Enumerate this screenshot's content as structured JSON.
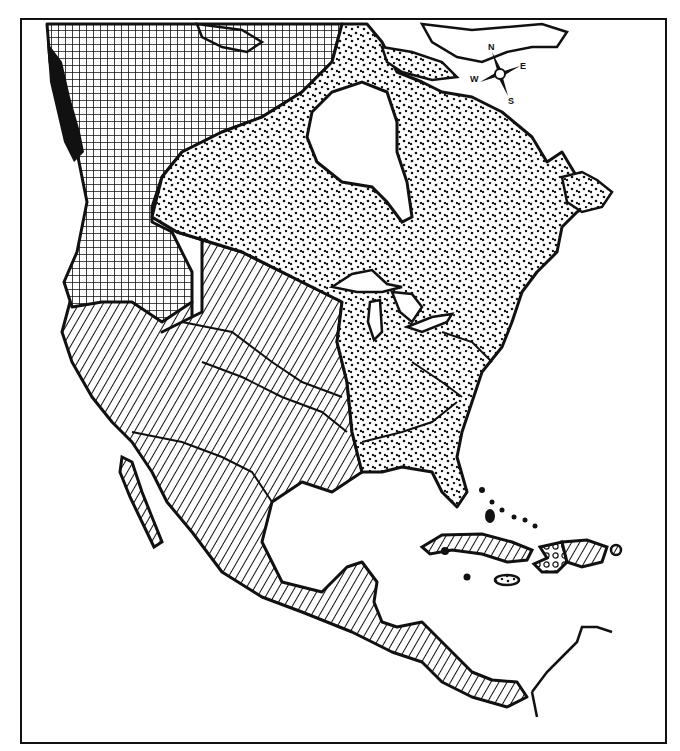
{
  "map": {
    "subject": "North America regional distribution map",
    "style": "black-and-white patterned fills",
    "colors": {
      "ink": "#111111",
      "paper": "#ffffff"
    },
    "compass": {
      "north": "N",
      "east": "E",
      "south": "S",
      "west": "W"
    },
    "regions": [
      {
        "id": "northwest-interior",
        "pattern": "crosshatch",
        "area": "Alaska, Yukon, western Canada, Great Basin/Plateau"
      },
      {
        "id": "pacific-coast",
        "pattern": "solid-black",
        "area": "Northwest Pacific coast strip"
      },
      {
        "id": "east-north",
        "pattern": "stipple-dots",
        "area": "Eastern Canada, eastern United States, Florida, Labrador, Newfoundland"
      },
      {
        "id": "southwest-mexico",
        "pattern": "diagonal-hatch",
        "area": "California, Southwest, Plains, Mexico, Central America, Cuba, eastern Hispaniola"
      },
      {
        "id": "haiti",
        "pattern": "circles",
        "area": "western Hispaniola"
      }
    ]
  }
}
